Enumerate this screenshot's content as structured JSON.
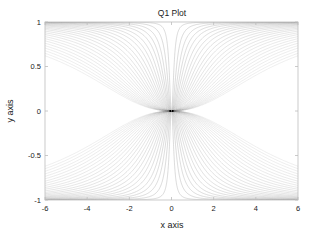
{
  "figure": {
    "background_color": "#ffffff",
    "axes_color": "#bdbdbd",
    "text_color": "#1a1a1a"
  },
  "chart_data": {
    "type": "line",
    "title": "Q1 Plot",
    "xlabel": "x axis",
    "ylabel": "y axis",
    "xlim": [
      -6,
      6
    ],
    "ylim": [
      -1,
      1
    ],
    "xticks": [
      -6,
      -4,
      -2,
      0,
      2,
      4,
      6
    ],
    "xticklabels": [
      "-6",
      "-4",
      "-2",
      "0",
      "2",
      "4",
      "6"
    ],
    "yticks": [
      -1,
      -0.5,
      0,
      0.5,
      1
    ],
    "yticklabels": [
      "-1",
      "-0.5",
      "0",
      "0.5",
      "1"
    ],
    "grid": false,
    "legend": false,
    "line_color": "#9a9a9a",
    "line_width": 0.5,
    "family": {
      "form": "y = sign(x) / (1 + (c/|x|)^p)",
      "curve_count": 26,
      "c_min": 0.12,
      "c_max": 3.6,
      "p": 2.2,
      "mirrored_quadrants": true
    },
    "series": [
      {
        "name": "c=0.12",
        "c": 0.12
      },
      {
        "name": "c=0.24",
        "c": 0.24
      },
      {
        "name": "c=0.36",
        "c": 0.36
      },
      {
        "name": "c=0.48",
        "c": 0.48
      },
      {
        "name": "c=0.60",
        "c": 0.6
      },
      {
        "name": "c=0.74",
        "c": 0.74
      },
      {
        "name": "c=0.88",
        "c": 0.88
      },
      {
        "name": "c=1.02",
        "c": 1.02
      },
      {
        "name": "c=1.18",
        "c": 1.18
      },
      {
        "name": "c=1.34",
        "c": 1.34
      },
      {
        "name": "c=1.50",
        "c": 1.5
      },
      {
        "name": "c=1.68",
        "c": 1.68
      },
      {
        "name": "c=1.86",
        "c": 1.86
      },
      {
        "name": "c=2.04",
        "c": 2.04
      },
      {
        "name": "c=2.24",
        "c": 2.24
      },
      {
        "name": "c=2.44",
        "c": 2.44
      },
      {
        "name": "c=2.64",
        "c": 2.64
      },
      {
        "name": "c=2.86",
        "c": 2.86
      },
      {
        "name": "c=3.08",
        "c": 3.08
      },
      {
        "name": "c=3.30",
        "c": 3.3
      },
      {
        "name": "c=3.54",
        "c": 3.54
      },
      {
        "name": "c=3.78",
        "c": 3.78
      },
      {
        "name": "c=4.02",
        "c": 4.02
      },
      {
        "name": "c=4.28",
        "c": 4.28
      },
      {
        "name": "c=4.54",
        "c": 4.54
      },
      {
        "name": "c=4.80",
        "c": 4.8
      }
    ]
  },
  "geometry": {
    "plot_left": 45,
    "plot_right": 298,
    "plot_top": 22,
    "plot_bottom": 200,
    "title_x": 172,
    "title_y": 16,
    "xlabel_x": 172,
    "xlabel_y": 228,
    "ylabel_x": 13,
    "ylabel_y": 111
  }
}
